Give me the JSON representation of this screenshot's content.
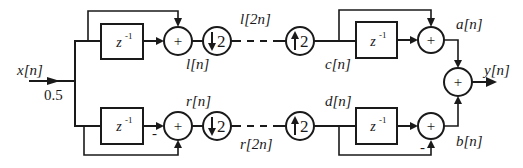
{
  "diagram": {
    "type": "block-diagram",
    "input": {
      "label": "x[n]",
      "gain": "0.5"
    },
    "output": {
      "label": "y[n]"
    },
    "delay_label": "z",
    "delay_exponent": "-1",
    "sum_symbol": "+",
    "minus_symbol": "-",
    "downsample": {
      "factor": "2"
    },
    "upsample": {
      "factor": "2"
    },
    "signals": {
      "l_n": "l[n]",
      "r_n": "r[n]",
      "l_2n": "l[2n]",
      "r_2n": "r[2n]",
      "c_n": "c[n]",
      "d_n": "d[n]",
      "a_n": "a[n]",
      "b_n": "b[n]"
    },
    "nodes": [
      {
        "id": "delay-top-left",
        "kind": "delay",
        "label": "z^-1"
      },
      {
        "id": "sum-top-left",
        "kind": "adder",
        "label": "+"
      },
      {
        "id": "down-top",
        "kind": "downsampler",
        "label": "↓2"
      },
      {
        "id": "up-top",
        "kind": "upsampler",
        "label": "↑2"
      },
      {
        "id": "delay-top-right",
        "kind": "delay",
        "label": "z^-1"
      },
      {
        "id": "sum-top-right",
        "kind": "adder",
        "label": "+"
      },
      {
        "id": "delay-bottom-left",
        "kind": "delay",
        "label": "z^-1"
      },
      {
        "id": "sum-bottom-left",
        "kind": "adder",
        "label": "+",
        "minus_input": "delay"
      },
      {
        "id": "down-bottom",
        "kind": "downsampler",
        "label": "↓2"
      },
      {
        "id": "up-bottom",
        "kind": "upsampler",
        "label": "↑2"
      },
      {
        "id": "delay-bottom-right",
        "kind": "delay",
        "label": "z^-1"
      },
      {
        "id": "sum-bottom-right",
        "kind": "adder",
        "label": "+",
        "minus_input": "feedforward"
      },
      {
        "id": "sum-output",
        "kind": "adder",
        "label": "+"
      }
    ]
  }
}
